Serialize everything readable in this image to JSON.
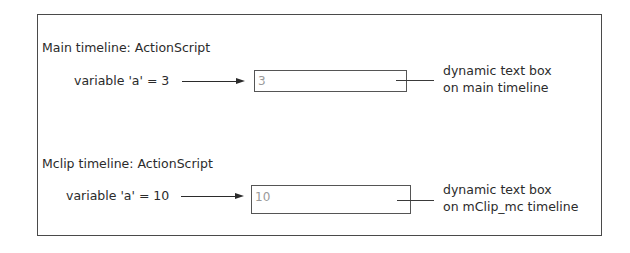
{
  "diagram": {
    "sections": [
      {
        "heading": "Main timeline: ActionScript",
        "variable_label": "variable 'a' = 3",
        "text_box_value": "3",
        "callout_line1": "dynamic text box",
        "callout_line2": "on main timeline"
      },
      {
        "heading": "Mclip timeline: ActionScript",
        "variable_label": "variable 'a' = 10",
        "text_box_value": "10",
        "callout_line1": "dynamic text box",
        "callout_line2": "on mClip_mc timeline"
      }
    ],
    "colors": {
      "border": "#4a4a4a",
      "text": "#2b2b2b",
      "text_box_value": "#9a9a9a",
      "background": "#ffffff"
    }
  }
}
